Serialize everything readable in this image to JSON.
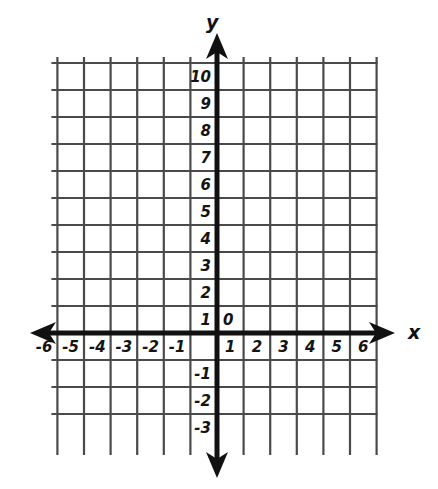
{
  "figure": {
    "kind": "cartesian-coordinate-plane",
    "background_color": "#ffffff",
    "grid_color": "#4a4a4a",
    "axis_color": "#111111",
    "label_color": "#141414"
  },
  "axes": {
    "x_axis_name": "x",
    "y_axis_name": "y",
    "origin_label": "0"
  },
  "x_tick_labels": [
    "-6",
    "-5",
    "-4",
    "-3",
    "-2",
    "-1",
    "1",
    "2",
    "3",
    "4",
    "5",
    "6"
  ],
  "y_tick_labels": [
    "10",
    "9",
    "8",
    "7",
    "6",
    "5",
    "4",
    "3",
    "2",
    "1",
    "-1",
    "-2",
    "-3"
  ],
  "chart_data": {
    "type": "scatter",
    "title": "",
    "subtitle": "",
    "xlabel": "x",
    "ylabel": "y",
    "grid": true,
    "legend": null,
    "series": [],
    "x": [],
    "values": [],
    "annotations": [
      "0"
    ],
    "xlim": [
      -6.5,
      6.5
    ],
    "ylim": [
      -3.5,
      10.5
    ],
    "xticks": [
      -6,
      -5,
      -4,
      -3,
      -2,
      -1,
      1,
      2,
      3,
      4,
      5,
      6
    ],
    "yticks": [
      10,
      9,
      8,
      7,
      6,
      5,
      4,
      3,
      2,
      1,
      -1,
      -2,
      -3
    ],
    "xtick_labels": [
      "-6",
      "-5",
      "-4",
      "-3",
      "-2",
      "-1",
      "1",
      "2",
      "3",
      "4",
      "5",
      "6"
    ],
    "ytick_labels": [
      "10",
      "9",
      "8",
      "7",
      "6",
      "5",
      "4",
      "3",
      "2",
      "1",
      "-1",
      "-2",
      "-3"
    ],
    "x_major_step": 1,
    "y_major_step": 1,
    "origin": [
      0,
      0
    ],
    "arrows": [
      "left",
      "right",
      "up",
      "down"
    ]
  },
  "geometry": {
    "origin_px": {
      "x": 217,
      "y": 333
    },
    "cell_w": 26.6,
    "cell_h": 27.0,
    "grid_left_px": 57,
    "grid_right_px": 376,
    "grid_top_px": 60,
    "grid_bottom_px": 438,
    "x_arrow_left_px": 30,
    "x_arrow_right_px": 395,
    "y_arrow_top_px": 33,
    "y_arrow_bottom_px": 478,
    "x_name_px": {
      "x": 408,
      "y": 333
    },
    "y_name_px": {
      "x": 206,
      "y": 25
    }
  }
}
